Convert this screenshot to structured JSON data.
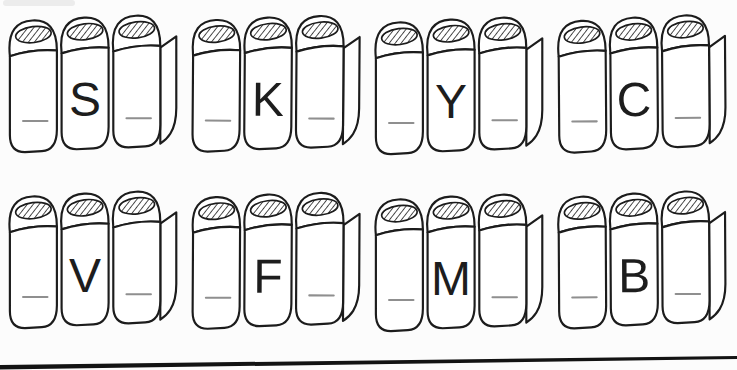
{
  "worksheet": {
    "background_color": "#fcfcfc",
    "ink_color": "#1c1c1c",
    "blank_line_color": "#8f8f8f",
    "rows": 2,
    "columns": 4,
    "blanks_per_group": 2,
    "illustration": "three-hardcover-books"
  },
  "groups": [
    {
      "letter": "S"
    },
    {
      "letter": "K"
    },
    {
      "letter": "Y"
    },
    {
      "letter": "C"
    },
    {
      "letter": "V"
    },
    {
      "letter": "F"
    },
    {
      "letter": "M"
    },
    {
      "letter": "B"
    }
  ]
}
